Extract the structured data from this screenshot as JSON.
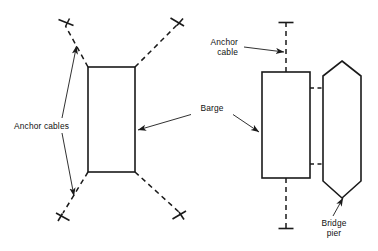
{
  "figure": {
    "background_color": "#ffffff",
    "line_color": "#1a1a1a"
  },
  "labels": {
    "anchor_cables_plural": "Anchor cables",
    "barge": "Barge",
    "anchor_cable_line1": "Anchor",
    "anchor_cable_line2": "cable",
    "bridge_pier_line1": "Bridge",
    "bridge_pier_line2": "pier"
  },
  "left_view": {
    "name": "barge-with-four-anchor-cables",
    "barge_rect": {
      "x": 88,
      "y": 67,
      "width": 47,
      "height": 105
    },
    "cables": [
      {
        "name": "cable-upper-left",
        "from_x": 88,
        "from_y": 67,
        "to_x": 65,
        "to_y": 25
      },
      {
        "name": "cable-upper-right",
        "from_x": 135,
        "from_y": 67,
        "to_x": 178,
        "to_y": 24
      },
      {
        "name": "cable-lower-left",
        "from_x": 88,
        "from_y": 172,
        "to_x": 62,
        "to_y": 215
      },
      {
        "name": "cable-lower-right",
        "from_x": 135,
        "from_y": 172,
        "to_x": 180,
        "to_y": 213
      }
    ]
  },
  "right_view": {
    "name": "barge-alongside-bridge-pier",
    "barge_rect": {
      "x": 262,
      "y": 72,
      "width": 48,
      "height": 106
    },
    "pier_hexagon": {
      "apex_x": 342,
      "top_y": 61,
      "left_x": 323,
      "right_x": 361,
      "shoulder_top_y": 76,
      "shoulder_bottom_y": 181,
      "bottom_y": 198
    },
    "cables": [
      {
        "name": "cable-top-vertical",
        "from_x": 286,
        "from_y": 72,
        "to_x": 286,
        "to_y": 22
      },
      {
        "name": "cable-bottom-vertical",
        "from_x": 286,
        "from_y": 178,
        "to_x": 286,
        "to_y": 228
      },
      {
        "name": "cable-upper-horizontal",
        "from_x": 310,
        "from_y": 88,
        "to_x": 323,
        "to_y": 88
      },
      {
        "name": "cable-lower-horizontal",
        "from_x": 310,
        "from_y": 164,
        "to_x": 323,
        "to_y": 164
      }
    ]
  }
}
